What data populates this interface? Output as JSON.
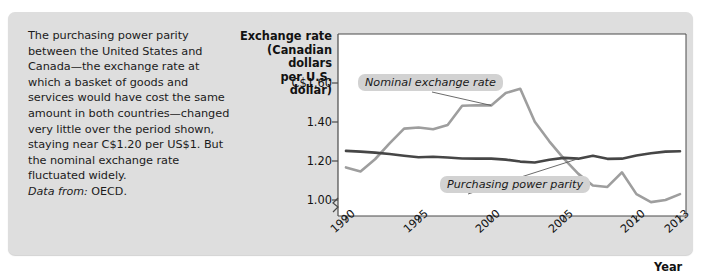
{
  "caption": {
    "body": "The purchasing power parity between the United States and Canada—the exchange rate at which a basket of goods and services would have cost the same amount in both countries—changed very little over the period shown, staying near C$1.20 per US$1. But the nominal exchange rate fluctuated widely.",
    "source_label": "Data from:",
    "source_value": "OECD."
  },
  "chart_data": {
    "type": "line",
    "title": "",
    "ylabel": "Exchange rate (Canadian dollars per U.S. dollar)",
    "ylabel_lines": [
      "Exchange rate",
      "(Canadian dollars",
      "per U.S. dollar)"
    ],
    "xlabel": "Year",
    "ytick_labels": [
      "C$1.60",
      "1.40",
      "1.20",
      "1.00"
    ],
    "ytick_values": [
      1.6,
      1.4,
      1.2,
      1.0
    ],
    "xtick_labels": [
      "1990",
      "1995",
      "2000",
      "2005",
      "2010",
      "2013"
    ],
    "xtick_values": [
      1990,
      1995,
      2000,
      2005,
      2010,
      2013
    ],
    "ylim": [
      0.95,
      1.68
    ],
    "xlim": [
      1990,
      2013
    ],
    "y_axis_break": true,
    "grid": false,
    "legend": "inline-callouts",
    "x": [
      1990,
      1991,
      1992,
      1993,
      1994,
      1995,
      1996,
      1997,
      1998,
      1999,
      2000,
      2001,
      2002,
      2003,
      2004,
      2005,
      2006,
      2007,
      2008,
      2009,
      2010,
      2011,
      2012,
      2013
    ],
    "series": [
      {
        "name": "Nominal exchange rate",
        "color": "#9e9e9e",
        "values": [
          1.167,
          1.146,
          1.209,
          1.29,
          1.366,
          1.372,
          1.363,
          1.385,
          1.483,
          1.486,
          1.485,
          1.549,
          1.57,
          1.401,
          1.301,
          1.212,
          1.134,
          1.074,
          1.067,
          1.142,
          1.03,
          0.989,
          1.0,
          1.03
        ]
      },
      {
        "name": "Purchasing power parity",
        "color": "#464646",
        "values": [
          1.252,
          1.248,
          1.243,
          1.236,
          1.227,
          1.219,
          1.222,
          1.218,
          1.213,
          1.212,
          1.212,
          1.207,
          1.197,
          1.192,
          1.206,
          1.216,
          1.212,
          1.227,
          1.211,
          1.212,
          1.228,
          1.24,
          1.248,
          1.25
        ]
      }
    ],
    "annotations": [
      {
        "text": "Nominal exchange rate",
        "target_year": 2000,
        "target_value": 1.485
      },
      {
        "text": "Purchasing power parity",
        "target_year": 2006,
        "target_value": 1.212
      }
    ]
  }
}
